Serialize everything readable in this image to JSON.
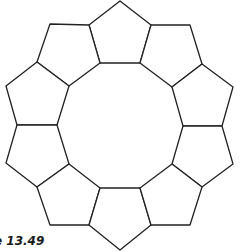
{
  "figure": {
    "caption": "e 13.49",
    "stroke_color": "#222222",
    "fill_color": "#ffffff",
    "pentagons": [
      {
        "name": "top",
        "points": "120,1 151,25 140,63 100,63 89,25"
      },
      {
        "name": "upper-left",
        "points": "50,24 89,25 100,63 69,86 37,62"
      },
      {
        "name": "upper-right",
        "points": "151,25 190,25 202,64 172,87 140,63"
      },
      {
        "name": "left-upper",
        "points": "37,62 69,86 57,125 17,125 6,86"
      },
      {
        "name": "right-upper",
        "points": "202,64 233,87 222,126 183,126 172,87"
      },
      {
        "name": "left-lower",
        "points": "17,125 57,125 69,164 37,187 6,163"
      },
      {
        "name": "right-lower",
        "points": "183,126 222,126 233,164 202,187 172,164"
      },
      {
        "name": "lower-left",
        "points": "37,187 69,164 100,188 89,225 50,225"
      },
      {
        "name": "bottom",
        "points": "100,188 140,188 151,225 120,250 89,225"
      },
      {
        "name": "lower-right",
        "points": "140,188 172,164 202,187 190,225 151,225"
      }
    ]
  }
}
